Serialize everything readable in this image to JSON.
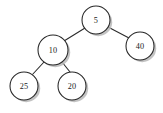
{
  "figure": {
    "type": "binary-tree",
    "background_color": "#ffffff",
    "node_fill_color": "#ffffff",
    "node_stroke_color": "#262626",
    "edge_color": "#2b2b2b",
    "label_color": "#1a1a1a",
    "shadow_color": "#b8b8b8",
    "width": 163,
    "height": 113
  },
  "tree": {
    "root": "n5",
    "nodes": [
      {
        "id": "n5",
        "label": "5",
        "cx": 96,
        "cy": 20,
        "r": 14.0
      },
      {
        "id": "n10",
        "label": "10",
        "cx": 53,
        "cy": 50,
        "r": 15.0
      },
      {
        "id": "n40",
        "label": "40",
        "cx": 140,
        "cy": 46,
        "r": 14.0
      },
      {
        "id": "n25",
        "label": "25",
        "cx": 24,
        "cy": 86,
        "r": 14.0
      },
      {
        "id": "n20",
        "label": "20",
        "cx": 72,
        "cy": 86,
        "r": 14.0
      }
    ],
    "edges": [
      {
        "id": "e-5-10",
        "from": "n5",
        "to": "n10",
        "x1": 85,
        "y1": 28,
        "x2": 64,
        "y2": 41
      },
      {
        "id": "e-5-40",
        "from": "n5",
        "to": "n40",
        "x1": 108,
        "y1": 27,
        "x2": 129,
        "y2": 38
      },
      {
        "id": "e-10-25",
        "from": "n10",
        "to": "n25",
        "x1": 44,
        "y1": 62,
        "x2": 32,
        "y2": 75
      },
      {
        "id": "e-10-20",
        "from": "n10",
        "to": "n20",
        "x1": 62,
        "y1": 62,
        "x2": 70,
        "y2": 72
      }
    ]
  }
}
